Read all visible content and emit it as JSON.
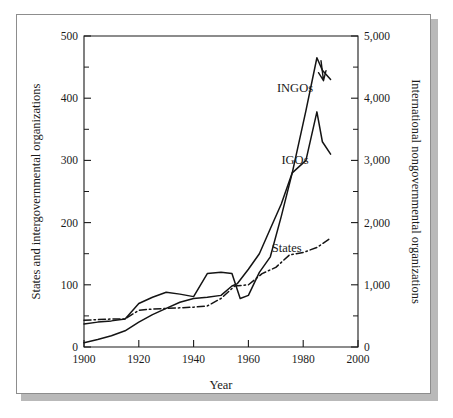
{
  "figure": {
    "background_color": "#ffffff",
    "card_border_color": "#8d8d8d",
    "shadow_color": "#b9b9b9",
    "line_color": "#141414"
  },
  "chart_data": {
    "type": "line",
    "title": "",
    "subtitle": "",
    "xlabel": "Year",
    "ylabel": "States and intergovernmental organizations",
    "y2label": "International nongovernmental organizations",
    "xlim": [
      1900,
      2000
    ],
    "ylim": [
      0,
      500
    ],
    "y2lim": [
      0,
      5000
    ],
    "grid": false,
    "legend_position": "inline-annotations",
    "xticks": [
      1900,
      1920,
      1940,
      1960,
      1980,
      2000
    ],
    "xtick_labels": [
      "1900",
      "1920",
      "1940",
      "1960",
      "1980",
      "2000"
    ],
    "yticks": [
      0,
      100,
      200,
      300,
      400,
      500
    ],
    "ytick_labels": [
      "0",
      "100",
      "200",
      "300",
      "400",
      "500"
    ],
    "yminor_ticks": [
      50,
      150,
      250,
      350,
      450
    ],
    "y2ticks": [
      0,
      1000,
      2000,
      3000,
      4000,
      5000
    ],
    "y2tick_labels": [
      "0",
      "1,000",
      "2,000",
      "3,000",
      "4,000",
      "5,000"
    ],
    "y2minor_ticks": [
      500,
      1500,
      2500,
      3500,
      4500
    ],
    "series": [
      {
        "name": "INGOs",
        "label": "INGOs",
        "axis": "right",
        "line_style": "solid",
        "x": [
          1900,
          1905,
          1910,
          1915,
          1920,
          1925,
          1930,
          1935,
          1940,
          1945,
          1950,
          1954,
          1956,
          1960,
          1964,
          1968,
          1972,
          1976,
          1981,
          1985,
          1987,
          1990
        ],
        "values": [
          70,
          120,
          180,
          260,
          400,
          520,
          620,
          720,
          780,
          800,
          830,
          980,
          1020,
          1250,
          1500,
          1900,
          2300,
          2800,
          3800,
          4650,
          4450,
          4300
        ]
      },
      {
        "name": "IGOs",
        "label": "IGOs",
        "axis": "left",
        "line_style": "solid",
        "x": [
          1900,
          1905,
          1910,
          1915,
          1920,
          1925,
          1930,
          1935,
          1940,
          1945,
          1950,
          1954,
          1957,
          1960,
          1964,
          1968,
          1972,
          1976,
          1981,
          1985,
          1987,
          1990
        ],
        "values": [
          37,
          40,
          42,
          45,
          70,
          80,
          88,
          85,
          81,
          118,
          120,
          118,
          78,
          83,
          120,
          145,
          210,
          280,
          300,
          378,
          330,
          310
        ]
      },
      {
        "name": "States",
        "label": "States",
        "axis": "left",
        "line_style": "dash-dot",
        "x": [
          1900,
          1905,
          1910,
          1915,
          1920,
          1925,
          1930,
          1935,
          1940,
          1945,
          1950,
          1955,
          1960,
          1965,
          1970,
          1975,
          1980,
          1985,
          1990
        ],
        "values": [
          43,
          44,
          45,
          45,
          59,
          61,
          62,
          63,
          64,
          66,
          78,
          98,
          100,
          118,
          128,
          148,
          152,
          160,
          175
        ]
      }
    ],
    "annotations": [
      {
        "text": "INGOs",
        "x_year": 1977,
        "y_left": 410
      },
      {
        "text": "IGOs",
        "x_year": 1977,
        "y_left": 295
      },
      {
        "text": "States",
        "x_year": 1974,
        "y_left": 152
      }
    ]
  }
}
